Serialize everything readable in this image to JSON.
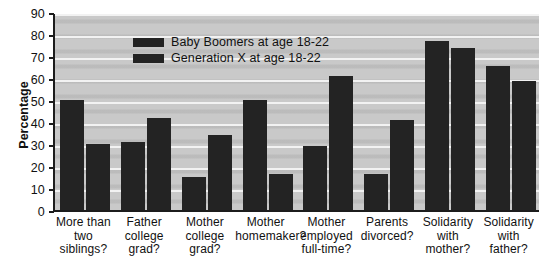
{
  "chart_data": {
    "type": "bar",
    "title": "",
    "xlabel": "",
    "ylabel": "Percentage",
    "ylim": [
      0,
      90
    ],
    "ytick_step": 10,
    "yticks": [
      0,
      10,
      20,
      30,
      40,
      50,
      60,
      70,
      80,
      90
    ],
    "grid": true,
    "legend_position": "top-left-inside",
    "categories": [
      "More than two siblings?",
      "Father college grad?",
      "Mother college grad?",
      "Mother homemaker?",
      "Mother employed full-time?",
      "Parents divorced?",
      "Solidarity with mother?",
      "Solidarity with father?"
    ],
    "category_lines": [
      [
        "More than",
        "two siblings?"
      ],
      [
        "Father",
        "college",
        "grad?"
      ],
      [
        "Mother",
        "college",
        "grad?"
      ],
      [
        "Mother",
        "homemaker?"
      ],
      [
        "Mother",
        "employed",
        "full-time?"
      ],
      [
        "Parents",
        "divorced?"
      ],
      [
        "Solidarity",
        "with",
        "mother?"
      ],
      [
        "Solidarity",
        "with",
        "father?"
      ]
    ],
    "series": [
      {
        "name": "Baby Boomers at age 18-22",
        "color": "#232323",
        "values": [
          50,
          31,
          15,
          50,
          29,
          16.5,
          77,
          65.5
        ]
      },
      {
        "name": "Generation X at age 18-22",
        "color": "#232323",
        "values": [
          30,
          42,
          34,
          16.5,
          61,
          41,
          73.5,
          58.5
        ]
      }
    ],
    "plot_background_color": "#c9c9c9",
    "gridline_color": "#f2f2f2",
    "axis_color": "#1c1c1c"
  },
  "legend": {
    "items": [
      {
        "label": "Baby Boomers at age 18-22"
      },
      {
        "label": "Generation X at age 18-22"
      }
    ]
  },
  "axis": {
    "y_title": "Percentage"
  }
}
